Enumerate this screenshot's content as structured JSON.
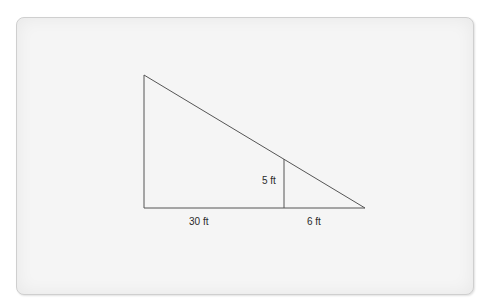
{
  "diagram": {
    "type": "similar-triangles",
    "labels": {
      "inner_height": "5 ft",
      "base_left": "30 ft",
      "base_right": "6 ft"
    },
    "colors": {
      "line": "#555555",
      "text": "#2a2a2a",
      "panel": "#f5f5f5",
      "panel_border": "#cfcfcf"
    }
  }
}
